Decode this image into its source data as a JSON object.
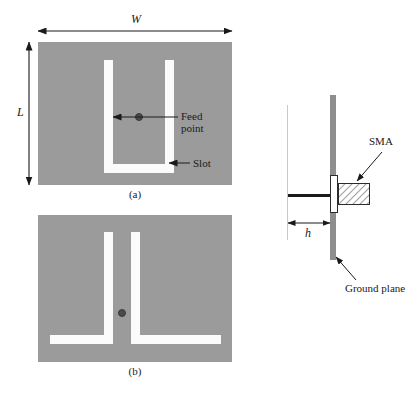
{
  "figure": {
    "panels": [
      {
        "id": "a",
        "caption": "(a)",
        "dimension_width_label": "W",
        "dimension_length_label": "L",
        "annotations": [
          {
            "name": "feed-point",
            "text": "Feed\npoint",
            "line1": "Feed",
            "line2": "point"
          },
          {
            "name": "slot",
            "text": "Slot"
          }
        ]
      },
      {
        "id": "b",
        "caption": "(b)"
      }
    ],
    "side_view": {
      "dimension_gap_label": "h",
      "annotations": [
        {
          "name": "sma",
          "text": "SMA"
        },
        {
          "name": "ground-plane",
          "text": "Ground plane"
        }
      ]
    },
    "colors": {
      "patch_metal": "#9b9b9b",
      "slot_fill": "#fbfbfb",
      "feed_dot": "#4a4a4a",
      "ground_plane": "#8e8e8e",
      "line": "#1a1a1a",
      "background": "#ffffff"
    }
  }
}
